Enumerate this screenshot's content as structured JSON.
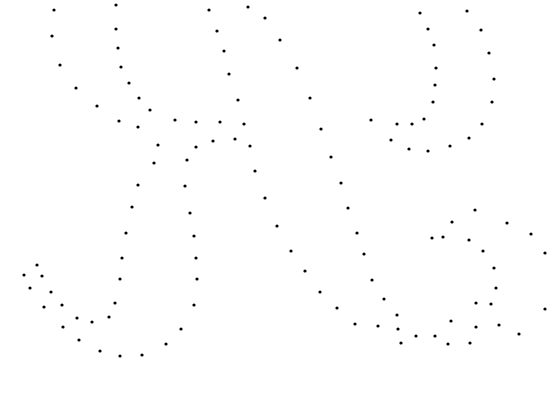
{
  "canvas": {
    "width": 549,
    "height": 399,
    "background": "#ffffff",
    "dot_color": "#000000",
    "dot_radius": 1.6
  },
  "dots": [
    [
      54,
      10
    ],
    [
      116,
      5
    ],
    [
      52,
      36
    ],
    [
      116,
      29
    ],
    [
      60,
      65
    ],
    [
      118,
      48
    ],
    [
      121,
      67
    ],
    [
      76,
      88
    ],
    [
      129,
      83
    ],
    [
      97,
      106
    ],
    [
      139,
      98
    ],
    [
      150,
      110
    ],
    [
      119,
      121
    ],
    [
      138,
      127
    ],
    [
      175,
      120
    ],
    [
      196,
      122
    ],
    [
      220,
      122
    ],
    [
      244,
      124
    ],
    [
      158,
      145
    ],
    [
      196,
      147
    ],
    [
      213,
      141
    ],
    [
      235,
      139
    ],
    [
      250,
      146
    ],
    [
      154,
      163
    ],
    [
      187,
      160
    ],
    [
      138,
      185
    ],
    [
      185,
      186
    ],
    [
      255,
      171
    ],
    [
      265,
      198
    ],
    [
      209,
      10
    ],
    [
      265,
      18
    ],
    [
      217,
      31
    ],
    [
      224,
      51
    ],
    [
      229,
      74
    ],
    [
      238,
      100
    ],
    [
      248,
      7
    ],
    [
      280,
      40
    ],
    [
      297,
      68
    ],
    [
      310,
      98
    ],
    [
      321,
      129
    ],
    [
      331,
      157
    ],
    [
      341,
      183
    ],
    [
      420,
      13
    ],
    [
      467,
      11
    ],
    [
      428,
      29
    ],
    [
      481,
      30
    ],
    [
      434,
      45
    ],
    [
      489,
      53
    ],
    [
      436,
      68
    ],
    [
      494,
      79
    ],
    [
      435,
      85
    ],
    [
      492,
      102
    ],
    [
      433,
      102
    ],
    [
      371,
      120
    ],
    [
      397,
      124
    ],
    [
      412,
      124
    ],
    [
      424,
      119
    ],
    [
      482,
      124
    ],
    [
      391,
      140
    ],
    [
      409,
      149
    ],
    [
      428,
      151
    ],
    [
      450,
      146
    ],
    [
      469,
      138
    ],
    [
      132,
      207
    ],
    [
      190,
      213
    ],
    [
      126,
      233
    ],
    [
      194,
      236
    ],
    [
      122,
      258
    ],
    [
      196,
      258
    ],
    [
      120,
      279
    ],
    [
      197,
      279
    ],
    [
      37,
      265
    ],
    [
      24,
      275
    ],
    [
      42,
      276
    ],
    [
      30,
      288
    ],
    [
      51,
      292
    ],
    [
      44,
      307
    ],
    [
      62,
      305
    ],
    [
      115,
      303
    ],
    [
      194,
      305
    ],
    [
      77,
      318
    ],
    [
      92,
      322
    ],
    [
      109,
      317
    ],
    [
      63,
      327
    ],
    [
      79,
      340
    ],
    [
      100,
      351
    ],
    [
      120,
      356
    ],
    [
      142,
      355
    ],
    [
      166,
      344
    ],
    [
      181,
      329
    ],
    [
      277,
      226
    ],
    [
      348,
      208
    ],
    [
      357,
      233
    ],
    [
      291,
      251
    ],
    [
      364,
      254
    ],
    [
      305,
      271
    ],
    [
      372,
      280
    ],
    [
      320,
      292
    ],
    [
      384,
      299
    ],
    [
      337,
      308
    ],
    [
      397,
      315
    ],
    [
      355,
      324
    ],
    [
      416,
      336
    ],
    [
      378,
      326
    ],
    [
      398,
      329
    ],
    [
      435,
      336
    ],
    [
      451,
      321
    ],
    [
      470,
      343
    ],
    [
      401,
      343
    ],
    [
      448,
      344
    ],
    [
      476,
      327
    ],
    [
      499,
      325
    ],
    [
      443,
      237
    ],
    [
      452,
      222
    ],
    [
      475,
      210
    ],
    [
      507,
      223
    ],
    [
      531,
      234
    ],
    [
      545,
      253
    ],
    [
      432,
      238
    ],
    [
      469,
      240
    ],
    [
      483,
      251
    ],
    [
      494,
      268
    ],
    [
      496,
      288
    ],
    [
      491,
      304
    ],
    [
      519,
      334
    ],
    [
      545,
      309
    ],
    [
      476,
      303
    ]
  ]
}
